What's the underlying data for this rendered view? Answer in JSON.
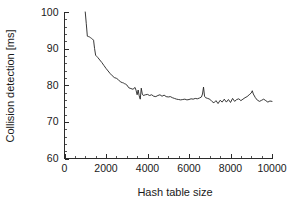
{
  "figure": {
    "background_color": "#ffffff",
    "line_color": "#232323",
    "axis_color": "#2b2b2b"
  },
  "chart_data": {
    "type": "line",
    "title": "",
    "xlabel": "Hash table size",
    "ylabel": "Collision detection [ms]",
    "xlim": [
      0,
      10000
    ],
    "ylim": [
      60,
      100
    ],
    "xticks": [
      0,
      2000,
      4000,
      6000,
      8000,
      10000
    ],
    "yticks": [
      60,
      70,
      80,
      90,
      100
    ],
    "xtick_labels": [
      "0",
      "2000",
      "4000",
      "6000",
      "8000",
      "10000"
    ],
    "ytick_labels": [
      "60",
      "70",
      "80",
      "90",
      "100"
    ],
    "x_minor_step": 500,
    "y_minor_step": 2,
    "grid": false,
    "legend": null,
    "series": [
      {
        "name": "collision detection time",
        "x": [
          1000,
          1050,
          1100,
          1150,
          1200,
          1250,
          1300,
          1350,
          1400,
          1450,
          1500,
          1550,
          1600,
          1700,
          1800,
          1900,
          2000,
          2100,
          2200,
          2300,
          2400,
          2500,
          2600,
          2700,
          2800,
          2850,
          2900,
          2950,
          3000,
          3100,
          3200,
          3300,
          3400,
          3450,
          3500,
          3550,
          3600,
          3650,
          3700,
          3750,
          3800,
          3900,
          4000,
          4100,
          4200,
          4300,
          4400,
          4500,
          4600,
          4700,
          4800,
          4900,
          5000,
          5100,
          5200,
          5300,
          5400,
          5500,
          5600,
          5700,
          5800,
          5900,
          6000,
          6100,
          6200,
          6300,
          6400,
          6500,
          6600,
          6650,
          6700,
          6750,
          6800,
          6900,
          7000,
          7100,
          7200,
          7300,
          7400,
          7500,
          7600,
          7700,
          7800,
          7900,
          8000,
          8100,
          8200,
          8300,
          8400,
          8500,
          8600,
          8700,
          8800,
          8900,
          9000,
          9050,
          9100,
          9200,
          9300,
          9400,
          9500,
          9600,
          9700,
          9800,
          9900,
          10000
        ],
        "y": [
          100.0,
          96.8,
          93.4,
          93.3,
          93.2,
          93.0,
          92.8,
          92.6,
          92.3,
          90.0,
          88.2,
          87.9,
          87.6,
          86.9,
          86.2,
          85.4,
          84.6,
          83.9,
          83.2,
          82.6,
          82.1,
          81.9,
          81.5,
          80.9,
          80.7,
          80.6,
          80.4,
          80.3,
          80.1,
          79.3,
          79.1,
          78.9,
          79.4,
          78.6,
          77.4,
          78.7,
          77.1,
          76.2,
          79.2,
          77.6,
          77.2,
          77.4,
          77.5,
          77.2,
          77.4,
          77.0,
          76.9,
          77.2,
          77.4,
          77.0,
          77.3,
          76.9,
          76.8,
          76.9,
          76.6,
          76.4,
          76.2,
          76.1,
          76.0,
          76.1,
          76.2,
          76.0,
          76.1,
          76.3,
          76.2,
          76.4,
          76.3,
          76.5,
          76.8,
          77.6,
          79.5,
          77.0,
          76.6,
          76.4,
          76.2,
          75.6,
          75.2,
          75.8,
          75.0,
          75.9,
          75.4,
          76.2,
          75.4,
          76.1,
          75.3,
          76.4,
          75.6,
          76.1,
          76.3,
          75.8,
          76.2,
          76.6,
          76.9,
          77.4,
          77.9,
          78.5,
          77.6,
          76.6,
          75.9,
          75.6,
          75.9,
          76.2,
          75.8,
          75.4,
          75.7,
          75.6
        ]
      }
    ]
  }
}
